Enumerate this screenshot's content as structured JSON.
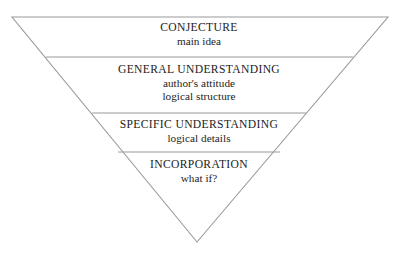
{
  "diagram": {
    "shape": "inverted-triangle",
    "background_color": "#ffffff",
    "outline_color": "#9a9a9a",
    "divider_color": "#9a9a9a",
    "text_color": "#1c1c1c",
    "vertices": {
      "top_left": {
        "x": 12,
        "y": 17
      },
      "top_right": {
        "x": 388,
        "y": 17
      },
      "apex": {
        "x": 197,
        "y": 242
      }
    },
    "dividers": [
      {
        "y": 57,
        "x_start": 46,
        "x_end": 353
      },
      {
        "y": 113,
        "x_start": 92,
        "x_end": 306
      },
      {
        "y": 152,
        "x_start": 118,
        "x_end": 280
      }
    ],
    "tiers": [
      {
        "id": "conjecture",
        "title": "CONJECTURE",
        "lines": [
          "main idea"
        ]
      },
      {
        "id": "general-understanding",
        "title": "GENERAL UNDERSTANDING",
        "lines": [
          "author's attitude",
          "logical structure"
        ]
      },
      {
        "id": "specific-understanding",
        "title": "SPECIFIC UNDERSTANDING",
        "lines": [
          "logical details"
        ]
      },
      {
        "id": "incorporation",
        "title": "INCORPORATION",
        "lines": [
          "what if?"
        ]
      }
    ]
  }
}
